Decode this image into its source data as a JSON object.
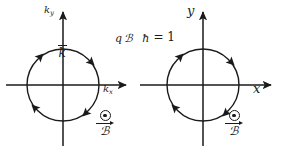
{
  "figure": {
    "background_color": "#ffffff",
    "stroke_color": "#1a1a1a",
    "width": 285,
    "height": 152
  },
  "equation": {
    "numerator_charge": "q",
    "numerator_field": "ℬ",
    "denominator": "ħ",
    "relation": "= 1",
    "full_text": "qℬ/ħ = 1"
  },
  "panels": [
    {
      "id": "momentum-space",
      "axis_x_label": "k",
      "axis_x_subscript": "x",
      "axis_y_label": "k",
      "axis_y_subscript": "y",
      "vector_label": "k",
      "vector_has_overbar": true,
      "orbit": {
        "center_x": 71,
        "center_y": 71,
        "radius": 36,
        "direction": "clockwise",
        "arrow_count": 4,
        "arrow_angles_deg": [
          45,
          135,
          225,
          315
        ]
      },
      "field_marker": {
        "symbol": "out-of-page",
        "glyph": "⊙",
        "label": "ℬ",
        "label_has_arrow": true
      }
    },
    {
      "id": "real-space",
      "axis_x_label": "x",
      "axis_x_subscript": "",
      "axis_y_label": "y",
      "axis_y_subscript": "",
      "vector_label": "",
      "vector_has_overbar": false,
      "orbit": {
        "center_x": 71,
        "center_y": 71,
        "radius": 36,
        "direction": "clockwise",
        "arrow_count": 4,
        "arrow_angles_deg": [
          45,
          135,
          225,
          315
        ]
      },
      "field_marker": {
        "symbol": "out-of-page",
        "glyph": "⊙",
        "label": "ℬ",
        "label_has_arrow": true
      }
    }
  ]
}
